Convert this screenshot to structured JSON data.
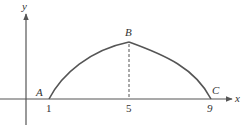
{
  "diagram": {
    "axes": {
      "x_label": "x",
      "y_label": "y"
    },
    "points": [
      {
        "name": "A",
        "x_value": 1
      },
      {
        "name": "B",
        "x_value": 5
      },
      {
        "name": "C",
        "x_value": 9
      }
    ],
    "ticks": [
      "1",
      "5",
      "9"
    ],
    "colors": {
      "curve": "#555555",
      "axis": "#555555",
      "dashed": "#555555",
      "text": "#333333"
    }
  }
}
